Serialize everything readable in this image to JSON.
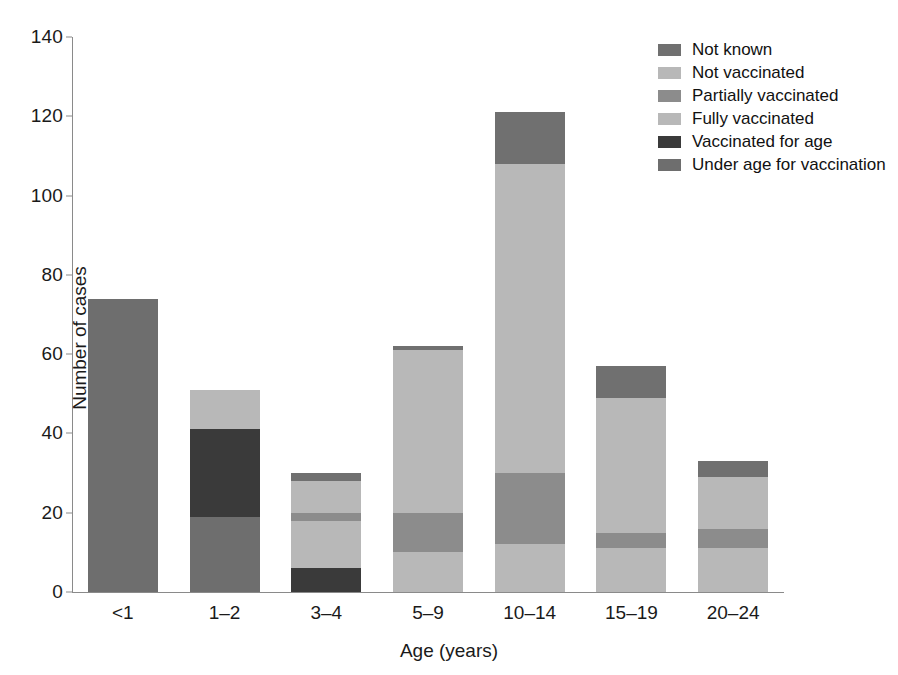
{
  "chart_data": {
    "type": "bar",
    "subtype": "stacked-bar",
    "title": "",
    "xlabel": "Age (years)",
    "ylabel": "Number of cases",
    "categories": [
      "<1",
      "1–2",
      "3–4",
      "5–9",
      "10–14",
      "15–19",
      "20–24"
    ],
    "ylim": [
      0,
      140
    ],
    "yticks": [
      0,
      20,
      40,
      60,
      80,
      100,
      120,
      140
    ],
    "ytick_labels": [
      "0",
      "20",
      "40",
      "60",
      "80",
      "100",
      "120",
      "140"
    ],
    "grid": false,
    "legend_position": "top-right",
    "stack_order_bottom_to_top": [
      "Under age for vaccination",
      "Vaccinated for age",
      "Fully vaccinated",
      "Partially vaccinated",
      "Not vaccinated",
      "Not known"
    ],
    "series": [
      {
        "name": "Not known",
        "color": "#707070",
        "values": [
          0,
          0,
          2,
          1,
          13,
          8,
          4
        ]
      },
      {
        "name": "Not vaccinated",
        "color": "#b8b8b8",
        "values": [
          0,
          0,
          8,
          41,
          78,
          34,
          13
        ]
      },
      {
        "name": "Partially vaccinated",
        "color": "#8c8c8c",
        "values": [
          0,
          0,
          2,
          10,
          18,
          4,
          5
        ]
      },
      {
        "name": "Fully vaccinated",
        "color": "#b8b8b8",
        "values": [
          0,
          10,
          12,
          10,
          12,
          11,
          11
        ]
      },
      {
        "name": "Vaccinated for age",
        "color": "#3a3a3a",
        "values": [
          0,
          22,
          6,
          0,
          0,
          0,
          0
        ]
      },
      {
        "name": "Under age for vaccination",
        "color": "#6e6e6e",
        "values": [
          74,
          19,
          0,
          0,
          0,
          0,
          0
        ]
      }
    ],
    "totals": [
      74,
      51,
      30,
      62,
      121,
      57,
      33
    ]
  },
  "legend": {
    "items": [
      {
        "label": "Not known",
        "color": "#707070"
      },
      {
        "label": "Not vaccinated",
        "color": "#b8b8b8"
      },
      {
        "label": "Partially vaccinated",
        "color": "#8c8c8c"
      },
      {
        "label": "Fully vaccinated",
        "color": "#b8b8b8"
      },
      {
        "label": "Vaccinated for age",
        "color": "#3a3a3a"
      },
      {
        "label": "Under age for vaccination",
        "color": "#6e6e6e"
      }
    ]
  },
  "axes": {
    "y_title": "Number of cases",
    "x_title": "Age (years)"
  },
  "style": {
    "axis_color": "#8a8a8a",
    "text_color": "#1a1a1a",
    "background": "#ffffff"
  }
}
